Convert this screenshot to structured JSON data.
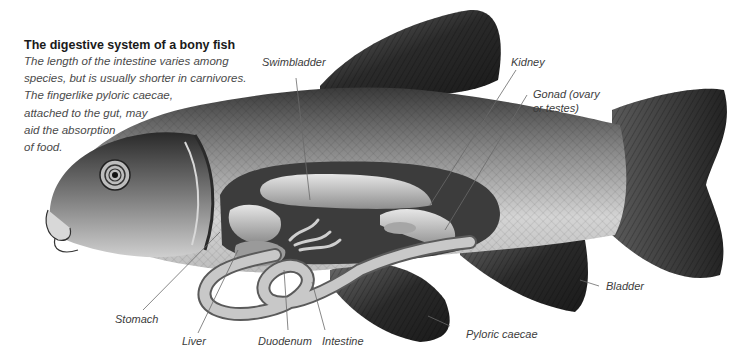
{
  "caption": {
    "title": "The digestive system of a bony fish",
    "body_lines": [
      "The length of the intestine varies among",
      "species, but is usually shorter in carnivores.",
      "The fingerlike pyloric caecae,",
      "attached to the gut, may",
      "aid the absorption",
      "of food."
    ]
  },
  "labels": {
    "swimbladder": "Swimbladder",
    "kidney": "Kidney",
    "gonad_line1": "Gonad (ovary",
    "gonad_line2": "or testes)",
    "stomach": "Stomach",
    "liver": "Liver",
    "duodenum": "Duodenum",
    "intestine": "Intestine",
    "pyloric_caecae": "Pyloric caecae",
    "bladder": "Bladder"
  },
  "colors": {
    "background": "#ffffff",
    "title_text": "#1a1a1a",
    "body_text": "#4a4a4a",
    "leader_line": "#6a6a6a",
    "fin_dark": "#2b2b2b",
    "body_scales": "#a8a8a8",
    "cavity": "#3a3a3a",
    "organs": "#bdbdbd"
  }
}
